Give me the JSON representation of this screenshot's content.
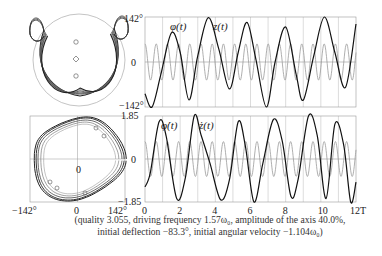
{
  "figure": {
    "caption_line1": "(quality 3.055, driving frequency 1.57ω₀, amplitude of the axis 40.0%,",
    "caption_line2": "initial deflection −83.3°, initial angular velocity −1.104ω₀)",
    "colors": {
      "primary_curve": "#111111",
      "secondary_curve": "#9a9a9a",
      "grid": "#b8b8b8",
      "frame": "#999999"
    }
  },
  "chart_data": [
    {
      "id": "pendulum-trajectory",
      "type": "diagram",
      "title": "",
      "description": "Pendulum trajectory inside circle with three markers on vertical axis"
    },
    {
      "id": "phase-portrait",
      "type": "line",
      "xlabel": "φ",
      "ylabel": "φ̇",
      "xlim": [
        -142,
        142
      ],
      "ylim": [
        -1.85,
        1.85
      ],
      "x_ticks": [
        "−142°",
        "0",
        "142°"
      ],
      "y_ticks": [
        "1.85",
        "0",
        "−1.85"
      ],
      "center_label": "0"
    },
    {
      "id": "angle-time",
      "type": "line",
      "xlim": [
        0,
        12
      ],
      "ylim": [
        -142,
        142
      ],
      "y_ticks": [
        "142°",
        "0",
        "−142°"
      ],
      "grid": true,
      "series": [
        {
          "name": "φ(t)",
          "label": "φ(t)",
          "style": "primary",
          "description": "growing-amplitude oscillation, period ≈ 2T",
          "x": [
            0,
            0.4,
            0.9,
            1.5,
            2.0,
            2.5,
            3.0,
            3.6,
            4.2,
            4.8,
            5.3,
            5.8,
            6.3,
            6.9,
            7.4,
            8.0,
            8.6,
            9.0,
            9.6,
            10.2,
            10.8,
            11.4,
            12.0
          ],
          "values": [
            -100,
            -142,
            -40,
            92,
            30,
            -120,
            20,
            140,
            40,
            -85,
            30,
            125,
            10,
            -142,
            0,
            110,
            -40,
            -120,
            20,
            142,
            30,
            -80,
            120
          ]
        },
        {
          "name": "z(t)",
          "label": "z(t)",
          "style": "secondary",
          "description": "axis displacement, sinusoidal, period ≈ 0.64T, amplitude ≈ 40% of scale",
          "amplitude": 57,
          "period": 0.637
        }
      ]
    },
    {
      "id": "velocity-time",
      "type": "line",
      "xlim": [
        0,
        12
      ],
      "ylim": [
        -1.85,
        1.85
      ],
      "x_ticks": [
        "0",
        "2",
        "4",
        "6",
        "8",
        "10",
        "12T"
      ],
      "y_ticks": [
        "1.85",
        "0",
        "−1.85"
      ],
      "grid": true,
      "series": [
        {
          "name": "φ̇(t)",
          "label": "φ̇(t)",
          "style": "primary",
          "x": [
            0,
            0.3,
            0.8,
            1.2,
            1.8,
            2.3,
            2.8,
            3.2,
            3.7,
            4.3,
            4.8,
            5.3,
            5.7,
            6.2,
            6.7,
            7.3,
            7.8,
            8.3,
            8.7,
            9.3,
            9.8,
            10.3,
            10.8,
            11.3,
            11.7,
            12.0
          ],
          "values": [
            -1.2,
            -0.6,
            1.6,
            1.0,
            -1.7,
            -0.8,
            1.85,
            1.0,
            -0.2,
            -1.75,
            -0.9,
            1.6,
            0.6,
            -1.85,
            -0.2,
            1.7,
            0.8,
            -1.6,
            -0.9,
            1.85,
            1.0,
            -1.7,
            1.5,
            0.6,
            -1.85,
            -1.0
          ]
        },
        {
          "name": "ż(t)",
          "label": "ż(t)",
          "style": "secondary",
          "amplitude": 0.75,
          "period": 0.637
        }
      ]
    }
  ]
}
